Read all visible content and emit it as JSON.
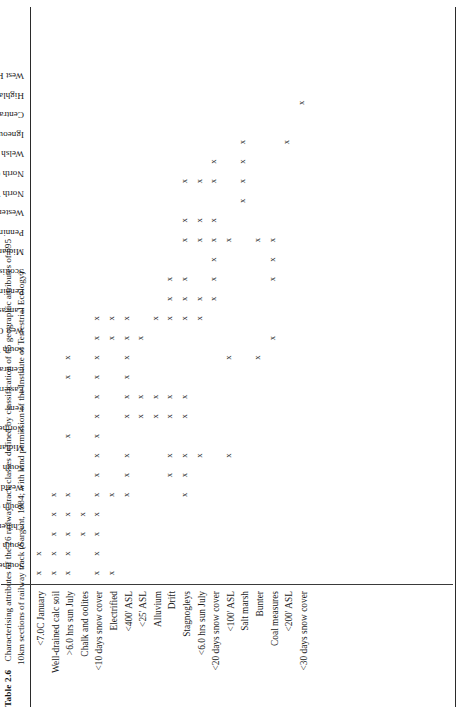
{
  "caption": {
    "number": "Table 2.6",
    "line1": "Characterising attributes of the 26 railway track classes defined by classification of 65 geographic attributes of 695",
    "line2": "10km sections of railway track (Sargent, 1984; with kind permission of the Institute of Terrestrial Ecology)"
  },
  "chart_data": {
    "type": "table",
    "title": "Characterising attributes of the 26 railway track classes",
    "orientation": "rotated-90-ccw",
    "mark": "x",
    "categories": [
      "Southern Chalk Uplands",
      "South Eastern",
      "Chilterns",
      "South Coastal",
      "Weald",
      "South Midlands",
      "Midlands & East Anglia",
      "Northern Sandstones",
      "Fens",
      "Eastern Lowlands",
      "Central Southern",
      "South Western",
      "West Coastal",
      "Lancashire Plain",
      "Pennine Coal Measures",
      "Scottish Lowlands",
      "Midland Hills",
      "Pennines",
      "Western Coal Measures",
      "North West Coastal",
      "North Coast Carboniferous",
      "Welsh Uplands",
      "Igneous Coastal",
      "Central Highlands",
      "Highland Coastal",
      "West Highlands"
    ],
    "rows": [
      "<7.0C January",
      "Well-drained calc soil",
      ">6.0 hrs sun July",
      "Chalk and oolites",
      "<10 days snow cover",
      "Electrified",
      "<400' ASL",
      "<25'  ASL",
      "Alluvium",
      "Drift",
      "Stagnogleys",
      "<6.0 hrs sun July",
      "<20 days snow cover",
      "<100' ASL",
      "Salt marsh",
      "Bunter",
      "Coal measures",
      "<200' ASL",
      "<30 days snow cover"
    ],
    "matrix": [
      [
        1,
        1,
        0,
        0,
        0,
        0,
        0,
        0,
        0,
        0,
        0,
        0,
        0,
        0,
        0,
        0,
        0,
        0,
        0,
        0,
        0,
        0,
        0,
        0,
        0,
        0
      ],
      [
        1,
        1,
        1,
        1,
        1,
        0,
        0,
        0,
        0,
        0,
        0,
        0,
        0,
        0,
        0,
        0,
        0,
        0,
        0,
        0,
        0,
        0,
        0,
        0,
        0,
        0
      ],
      [
        1,
        1,
        1,
        1,
        1,
        0,
        0,
        1,
        0,
        0,
        1,
        1,
        0,
        0,
        0,
        0,
        0,
        0,
        0,
        0,
        0,
        0,
        0,
        0,
        0,
        0
      ],
      [
        0,
        0,
        1,
        1,
        0,
        0,
        0,
        0,
        0,
        0,
        0,
        0,
        0,
        0,
        0,
        0,
        0,
        0,
        0,
        0,
        0,
        0,
        0,
        0,
        0,
        0
      ],
      [
        1,
        1,
        1,
        1,
        1,
        1,
        1,
        1,
        1,
        1,
        1,
        1,
        1,
        1,
        0,
        0,
        0,
        0,
        0,
        0,
        0,
        0,
        0,
        0,
        0,
        0
      ],
      [
        1,
        0,
        0,
        0,
        1,
        0,
        0,
        0,
        0,
        0,
        0,
        0,
        1,
        1,
        0,
        0,
        0,
        0,
        0,
        0,
        0,
        0,
        0,
        0,
        0,
        0
      ],
      [
        0,
        0,
        0,
        0,
        1,
        1,
        1,
        0,
        1,
        1,
        1,
        1,
        1,
        1,
        0,
        0,
        0,
        0,
        0,
        0,
        0,
        0,
        0,
        0,
        0,
        0
      ],
      [
        0,
        0,
        0,
        0,
        0,
        0,
        0,
        0,
        1,
        1,
        0,
        0,
        1,
        0,
        0,
        0,
        0,
        0,
        0,
        0,
        0,
        0,
        0,
        0,
        0,
        0
      ],
      [
        0,
        0,
        0,
        0,
        0,
        0,
        0,
        0,
        1,
        1,
        0,
        0,
        0,
        1,
        0,
        0,
        0,
        0,
        0,
        0,
        0,
        0,
        0,
        0,
        0,
        0
      ],
      [
        0,
        0,
        0,
        0,
        0,
        1,
        1,
        0,
        1,
        1,
        0,
        0,
        0,
        1,
        1,
        1,
        0,
        0,
        0,
        0,
        0,
        0,
        0,
        0,
        0,
        0
      ],
      [
        0,
        0,
        0,
        0,
        1,
        1,
        1,
        0,
        1,
        1,
        0,
        0,
        0,
        1,
        1,
        1,
        0,
        1,
        1,
        0,
        1,
        0,
        0,
        0,
        0,
        0
      ],
      [
        0,
        0,
        0,
        0,
        0,
        0,
        1,
        0,
        0,
        0,
        0,
        0,
        0,
        1,
        1,
        0,
        0,
        1,
        1,
        0,
        1,
        0,
        0,
        0,
        0,
        0
      ],
      [
        0,
        0,
        0,
        0,
        0,
        0,
        0,
        0,
        0,
        0,
        0,
        0,
        0,
        0,
        1,
        1,
        1,
        1,
        1,
        0,
        1,
        1,
        0,
        0,
        0,
        0
      ],
      [
        0,
        0,
        0,
        0,
        0,
        0,
        1,
        0,
        0,
        0,
        0,
        1,
        0,
        0,
        0,
        0,
        0,
        1,
        0,
        0,
        0,
        0,
        0,
        0,
        0,
        0
      ],
      [
        0,
        0,
        0,
        0,
        0,
        0,
        0,
        0,
        0,
        0,
        0,
        0,
        0,
        0,
        0,
        0,
        0,
        0,
        0,
        1,
        1,
        1,
        1,
        0,
        0,
        0
      ],
      [
        0,
        0,
        0,
        0,
        0,
        0,
        0,
        0,
        0,
        0,
        0,
        1,
        0,
        0,
        0,
        0,
        0,
        1,
        0,
        0,
        0,
        0,
        0,
        0,
        0,
        0
      ],
      [
        0,
        0,
        0,
        0,
        0,
        0,
        0,
        0,
        0,
        0,
        0,
        0,
        1,
        0,
        0,
        1,
        1,
        1,
        0,
        0,
        0,
        0,
        0,
        0,
        0,
        0
      ],
      [
        0,
        0,
        0,
        0,
        0,
        0,
        0,
        0,
        0,
        0,
        0,
        0,
        0,
        0,
        0,
        0,
        0,
        0,
        0,
        0,
        0,
        0,
        1,
        0,
        0,
        0
      ],
      [
        0,
        0,
        0,
        0,
        0,
        0,
        0,
        0,
        0,
        0,
        0,
        0,
        0,
        0,
        0,
        0,
        0,
        0,
        0,
        0,
        0,
        0,
        0,
        0,
        1,
        0
      ]
    ]
  }
}
